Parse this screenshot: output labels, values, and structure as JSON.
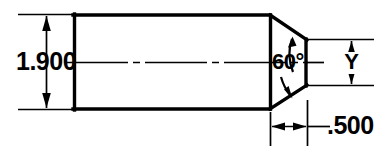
{
  "drawing": {
    "title": "Chamfered point part dimension drawing",
    "background_color": "#ffffff",
    "line_color": "#000000",
    "dimensions": [
      {
        "id": "overall-diameter",
        "label": "1.900",
        "orientation": "vertical",
        "position": "left",
        "arrow_style": "inside-pointing-out"
      },
      {
        "id": "point-angle",
        "label": "60°",
        "orientation": "angular",
        "position": "center-right",
        "arrow_style": "curved-leaders"
      },
      {
        "id": "flat-face-height",
        "label": "Y",
        "orientation": "vertical",
        "position": "right",
        "arrow_style": "inside-pointing-out"
      },
      {
        "id": "point-length",
        "label": ".500",
        "orientation": "horizontal",
        "position": "bottom-right",
        "arrow_style": "inside-pointing-out"
      }
    ],
    "features": {
      "body": "rectangle",
      "end": "symmetric-chamfered-point",
      "centerline": "dash-dot-horizontal"
    }
  }
}
